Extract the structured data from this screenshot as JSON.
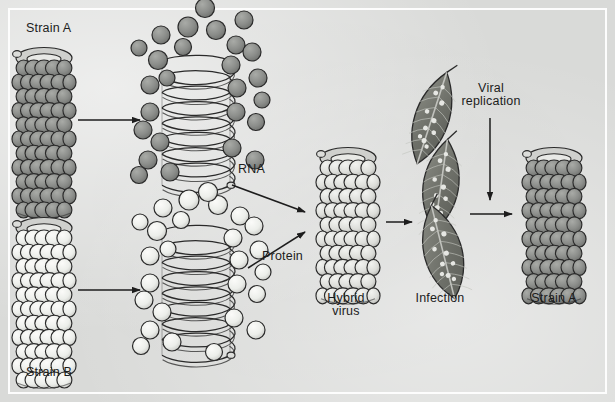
{
  "figure": {
    "background_color": "#d9dad8",
    "frame_color": "#fdfdfd",
    "ink_color": "#1c1c1c"
  },
  "palette": {
    "strain_a_subunit": "#8b8d8a",
    "strain_a_subunit_dark": "#6f716e",
    "strain_b_subunit": "#e4e5e2",
    "strain_b_subunit_dark": "#b9bab7",
    "helix_fill": "#d2d3d0",
    "leaf_fill": "#74766f",
    "leaf_spot": "#e6e7e3",
    "outline": "#2a2a2a"
  },
  "labels": {
    "strain_a_start": "Strain A",
    "strain_b_start": "Strain B",
    "rna": "RNA",
    "protein": "Protein",
    "hybrid_virus": "Hybrid\nvirus",
    "infection": "Infection",
    "viral_replication": "Viral\nreplication",
    "strain_a_end": "Strain A"
  },
  "elements": {
    "virus_strain_a": "intact rod-shaped virus particle, dark gray protein subunits",
    "virus_strain_b": "intact rod-shaped virus particle, light/white protein subunits",
    "helix_a": "RNA helix of strain A with dissociated dark protein subunits",
    "helix_b": "RNA helix of strain B with dissociated light protein subunits",
    "hybrid": "reconstituted hybrid virus: strain A RNA + strain B protein coat",
    "leaves": "three infected tobacco leaves showing lesion spots",
    "virus_final": "progeny virus identical to strain A"
  },
  "arrows": [
    {
      "name": "strain-a-dissociation-arrow",
      "from": "Strain A virus",
      "to": "Strain A RNA + protein"
    },
    {
      "name": "strain-b-dissociation-arrow",
      "from": "Strain B virus",
      "to": "Strain B RNA + protein"
    },
    {
      "name": "rna-to-hybrid-arrow",
      "from": "RNA",
      "to": "Hybrid virus"
    },
    {
      "name": "protein-to-hybrid-arrow",
      "from": "Protein",
      "to": "Hybrid virus"
    },
    {
      "name": "hybrid-to-infection-arrow",
      "from": "Hybrid virus",
      "to": "Infection"
    },
    {
      "name": "viral-replication-arrow",
      "from": "Viral replication",
      "to": "progeny"
    },
    {
      "name": "infection-to-strain-a-arrow",
      "from": "Infection",
      "to": "Strain A"
    }
  ]
}
